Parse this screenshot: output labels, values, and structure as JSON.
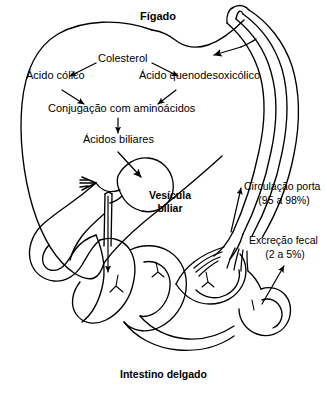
{
  "figure": {
    "title_top": "Fígado",
    "title_bottom": "Intestino delgado",
    "organ_labels": {
      "liver": "Fígado",
      "gallbladder_line1": "Vesícula",
      "gallbladder_line2": "biliar",
      "small_intestine": "Intestino delgado"
    },
    "pathway": {
      "cholesterol": "Colesterol",
      "cholic_acid": "Ácido cólico",
      "chenodeoxycholic_acid": "Ácido quenodesoxicólico",
      "conjugation": "Conjugação com aminoácidos",
      "bile_acids": "Ácidos biliares"
    },
    "flows": {
      "portal_line1": "Circulação porta",
      "portal_line2": "(95 a 98%)",
      "fecal_line1": "Excreção fecal",
      "fecal_line2": "(2 a 5%)"
    },
    "colors": {
      "stroke": "#000000",
      "background": "#ffffff"
    }
  }
}
